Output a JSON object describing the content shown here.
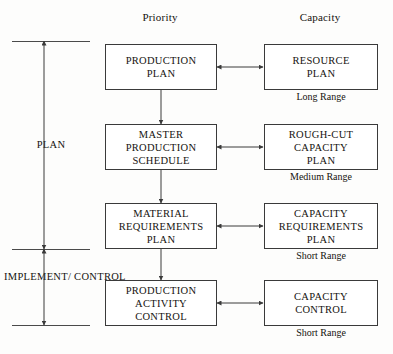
{
  "diagram": {
    "headers": {
      "priority": "Priority",
      "capacity": "Capacity"
    },
    "bracket": {
      "plan_label": "PLAN",
      "implement_label_line1": "IMPLEMENT/",
      "implement_label_line2": "CONTROL"
    },
    "rows": [
      {
        "priority": {
          "line1": "PRODUCTION",
          "line2": "PLAN",
          "line3": ""
        },
        "capacity": {
          "line1": "RESOURCE",
          "line2": "PLAN",
          "line3": ""
        },
        "range": "Long Range"
      },
      {
        "priority": {
          "line1": "MASTER",
          "line2": "PRODUCTION",
          "line3": "SCHEDULE"
        },
        "capacity": {
          "line1": "ROUGH-CUT",
          "line2": "CAPACITY",
          "line3": "PLAN"
        },
        "range": "Medium Range"
      },
      {
        "priority": {
          "line1": "MATERIAL",
          "line2": "REQUIREMENTS",
          "line3": "PLAN"
        },
        "capacity": {
          "line1": "CAPACITY",
          "line2": "REQUIREMENTS",
          "line3": "PLAN"
        },
        "range": "Short Range"
      },
      {
        "priority": {
          "line1": "PRODUCTION",
          "line2": "ACTIVITY",
          "line3": "CONTROL"
        },
        "capacity": {
          "line1": "CAPACITY",
          "line2": "CONTROL",
          "line3": ""
        },
        "range": "Short Range"
      }
    ],
    "colors": {
      "background": "#fdfdfc",
      "box_border": "#3a3a3a",
      "box_fill": "#ffffff",
      "line": "#3a3a3a",
      "text": "#15130f"
    }
  }
}
